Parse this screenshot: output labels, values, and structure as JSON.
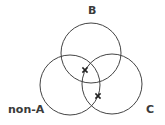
{
  "diagram": {
    "type": "venn-3-set",
    "stroke_color": "#444444",
    "label_color": "#3a3a3a",
    "background": "#ffffff",
    "sets": [
      {
        "id": "B",
        "label": "B",
        "cx": 91,
        "cy": 53,
        "r": 30
      },
      {
        "id": "non-A",
        "label": "non-A",
        "cx": 70,
        "cy": 85,
        "r": 30
      },
      {
        "id": "C",
        "label": "C",
        "cx": 112,
        "cy": 84,
        "r": 30
      }
    ],
    "markers": [
      {
        "symbol": "x",
        "region": "B ∩ non-A ∩ C",
        "x": 85,
        "y": 70
      },
      {
        "symbol": "x",
        "region": "non-A ∩ C (outside B)",
        "x": 98,
        "y": 96
      }
    ]
  },
  "labels": {
    "b": "B",
    "non_a": "non-A",
    "c": "C"
  }
}
